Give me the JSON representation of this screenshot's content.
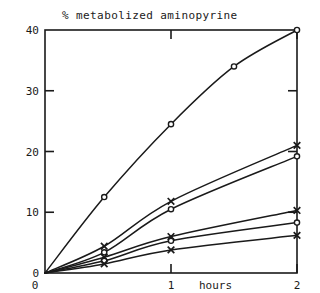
{
  "chart_data": {
    "type": "line",
    "title": "% metabolized aminopyrine",
    "xlabel": "hours",
    "ylabel": "",
    "xlim": [
      0,
      2
    ],
    "ylim": [
      0,
      40
    ],
    "xticks": [
      "0",
      "1",
      "2"
    ],
    "xtick_values": [
      0,
      1,
      2
    ],
    "yticks": [
      "0",
      "10",
      "20",
      "30",
      "40"
    ],
    "ytick_values": [
      0,
      10,
      20,
      30,
      40
    ],
    "grid": false,
    "legend": "none",
    "frame": "box",
    "series": [
      {
        "name": "curve-1",
        "marker": "circle",
        "x": [
          0,
          0.47,
          1.0,
          1.5,
          2.0
        ],
        "values": [
          0,
          12.5,
          24.5,
          34.0,
          40.0
        ]
      },
      {
        "name": "curve-2",
        "marker": "cross",
        "x": [
          0,
          0.47,
          1.0,
          2.0
        ],
        "values": [
          0,
          4.4,
          11.8,
          21.0
        ]
      },
      {
        "name": "curve-3",
        "marker": "circle",
        "x": [
          0,
          0.47,
          1.0,
          2.0
        ],
        "values": [
          0,
          3.4,
          10.5,
          19.2
        ]
      },
      {
        "name": "curve-4",
        "marker": "cross",
        "x": [
          0,
          0.47,
          1.0,
          2.0
        ],
        "values": [
          0,
          2.6,
          6.0,
          10.3
        ]
      },
      {
        "name": "curve-5",
        "marker": "circle",
        "x": [
          0,
          0.47,
          1.0,
          2.0
        ],
        "values": [
          0,
          2.0,
          5.3,
          8.3
        ]
      },
      {
        "name": "curve-6",
        "marker": "cross",
        "x": [
          0,
          0.47,
          1.0,
          2.0
        ],
        "values": [
          0,
          1.5,
          3.8,
          6.2
        ]
      }
    ],
    "colors": {
      "line": "#1a1a1a",
      "axis": "#1a1a1a",
      "background": "#ffffff"
    }
  }
}
